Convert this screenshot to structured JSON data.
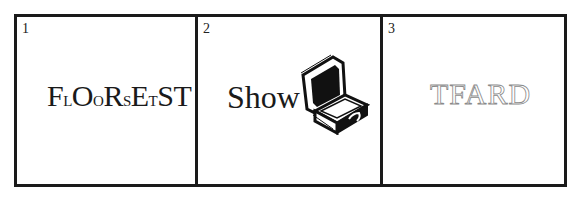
{
  "puzzle": {
    "panels": [
      {
        "number": "1",
        "letters": [
          {
            "char": "F",
            "size": "big"
          },
          {
            "char": "L",
            "size": "small"
          },
          {
            "char": "O",
            "size": "big"
          },
          {
            "char": "O",
            "size": "small"
          },
          {
            "char": "R",
            "size": "big"
          },
          {
            "char": "S",
            "size": "small"
          },
          {
            "char": "E",
            "size": "big"
          },
          {
            "char": "T",
            "size": "small"
          },
          {
            "char": "S",
            "size": "big"
          },
          {
            "char": "T",
            "size": "big"
          }
        ]
      },
      {
        "number": "2",
        "text": "Show",
        "icon": "open-briefcase-icon"
      },
      {
        "number": "3",
        "text": "TFARD",
        "style": "outline",
        "outline_color": "#8a8a8a"
      }
    ],
    "border_color": "#1a1a1a"
  }
}
